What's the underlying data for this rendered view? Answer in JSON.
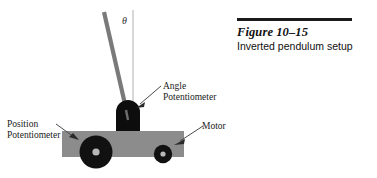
{
  "figure": {
    "title": "Figure 10–15",
    "subtitle": "Inverted pendulum setup"
  },
  "labels": {
    "angle_line1": "Angle",
    "angle_line2": "Potentiometer",
    "position_line1": "Position",
    "position_line2": "Potentiometer",
    "motor": "Motor",
    "theta": "θ"
  },
  "colors": {
    "cart_body": "#8c8c8c",
    "pivot_block": "#0d0d0d",
    "wheel": "#111111",
    "wheel_hub": "#b5b5b5",
    "rod": "#787878",
    "reference_line": "#c9c9c9",
    "leader_line": "#555555",
    "rule": "#1a1a1a",
    "text": "#101010",
    "background": "#ffffff"
  },
  "geometry": {
    "cart_x": 62,
    "cart_y": 131,
    "cart_width": 122,
    "cart_height": 26,
    "pivot_cx": 128,
    "pivot_top_y": 100,
    "rod_top_x": 104,
    "rod_top_y": 12,
    "rod_bottom_x": 127,
    "rod_bottom_y": 112,
    "big_wheel_cx": 96,
    "big_wheel_cy": 152,
    "big_wheel_r": 16,
    "small_wheel_cx": 163,
    "small_wheel_cy": 155,
    "small_wheel_r": 9,
    "reference_line_x": 133,
    "reference_line_top": 10,
    "reference_line_bottom": 104
  }
}
